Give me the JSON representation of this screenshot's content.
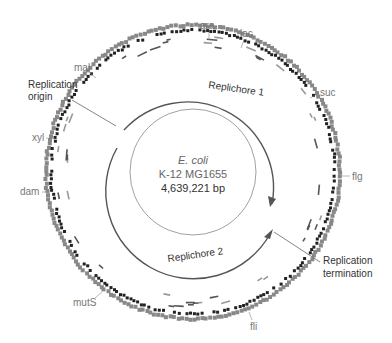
{
  "genome": {
    "organism": "E. coli",
    "strain": "K-12 MG1655",
    "size": "4,639,221 bp"
  },
  "replichores": [
    {
      "label": "Replichore 1"
    },
    {
      "label": "Replichore 2"
    }
  ],
  "annotations": {
    "origin": {
      "line1": "Replication",
      "line2": "origin"
    },
    "termination": {
      "line1": "Replication",
      "line2": "termination"
    }
  },
  "gene_labels": [
    {
      "name": "ara"
    },
    {
      "name": "lac"
    },
    {
      "name": "suc"
    },
    {
      "name": "flg"
    },
    {
      "name": "fli"
    },
    {
      "name": "mutS"
    },
    {
      "name": "dam"
    },
    {
      "name": "xyl"
    },
    {
      "name": "mal"
    }
  ],
  "colors": {
    "gene_light": "#888888",
    "gene_dark": "#222222",
    "ring_line": "#555555",
    "label_gray": "#777777"
  }
}
